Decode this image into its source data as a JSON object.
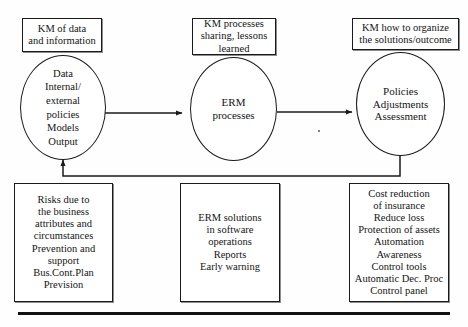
{
  "diagram": {
    "colors": {
      "stroke": "#1a1a1a",
      "text": "#141414",
      "background": "#ffffff"
    },
    "captions": [
      {
        "id": "km-data",
        "lines": [
          "KM of data",
          "and information"
        ]
      },
      {
        "id": "km-processes",
        "lines": [
          "KM processes",
          "sharing, lessons",
          "learned"
        ]
      },
      {
        "id": "km-organize",
        "lines": [
          "KM how to organize",
          "the solutions/outcome"
        ]
      }
    ],
    "processes": [
      {
        "id": "data-inputs",
        "lines": [
          "Data",
          "Internal/",
          "external",
          "policies",
          "Models",
          "Output"
        ]
      },
      {
        "id": "erm-processes",
        "lines": [
          "ERM",
          "processes"
        ]
      },
      {
        "id": "policies-outcomes",
        "lines": [
          "Policies",
          "Adjustments",
          "Assessment"
        ]
      }
    ],
    "outcomes": [
      {
        "id": "risks",
        "lines": [
          "Risks due to",
          "the business",
          "attributes and",
          "circumstances",
          "Prevention and",
          "support",
          "Bus.Cont.Plan",
          "Prevision"
        ]
      },
      {
        "id": "erm-solutions",
        "lines": [
          "ERM solutions",
          "in software",
          "operations",
          "Reports",
          "Early warning"
        ]
      },
      {
        "id": "benefits",
        "lines": [
          "Cost reduction",
          "of insurance",
          "Reduce loss",
          "Protection of assets",
          "Automation",
          "Awareness",
          "Control tools",
          "Automatic Dec. Proc",
          "Control panel"
        ]
      }
    ],
    "connectors": [
      {
        "id": "data-to-erm",
        "kind": "arrow-right"
      },
      {
        "id": "erm-to-policies",
        "kind": "arrow-right"
      },
      {
        "id": "feedback-loop",
        "kind": "arrow-up-feedback"
      }
    ]
  }
}
